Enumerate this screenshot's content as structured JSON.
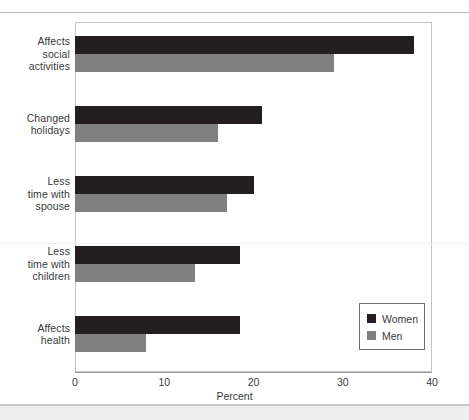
{
  "page": {
    "top_clipped_text": "",
    "background_color": "#ffffff"
  },
  "legend": {
    "position": "inside-bottom-right",
    "entries": [
      {
        "label": "Women",
        "color": "#231f20"
      },
      {
        "label": "Men",
        "color": "#808080"
      }
    ]
  },
  "axis": {
    "x_title": "Percent",
    "x_ticks": [
      "0",
      "10",
      "20",
      "30",
      "40"
    ]
  },
  "chart_data": {
    "type": "bar",
    "orientation": "horizontal",
    "title": "",
    "xlabel": "Percent",
    "ylabel": "",
    "xlim": [
      0,
      40
    ],
    "xticks": [
      0,
      10,
      20,
      30,
      40
    ],
    "grid": false,
    "legend_position": "inside-bottom-right",
    "categories": [
      "Affects social activities",
      "Changed holidays",
      "Less time with spouse",
      "Less time with children",
      "Affects health"
    ],
    "category_label_lines": [
      [
        "Affects",
        "social",
        "activities"
      ],
      [
        "Changed",
        "holidays"
      ],
      [
        "Less",
        "time with",
        "spouse"
      ],
      [
        "Less",
        "time with",
        "children"
      ],
      [
        "Affects",
        "health"
      ]
    ],
    "series": [
      {
        "name": "Women",
        "color": "#231f20",
        "values": [
          38,
          21,
          20,
          18.5,
          18.5
        ]
      },
      {
        "name": "Men",
        "color": "#808080",
        "values": [
          29,
          16,
          17,
          13.5,
          8
        ]
      }
    ]
  }
}
